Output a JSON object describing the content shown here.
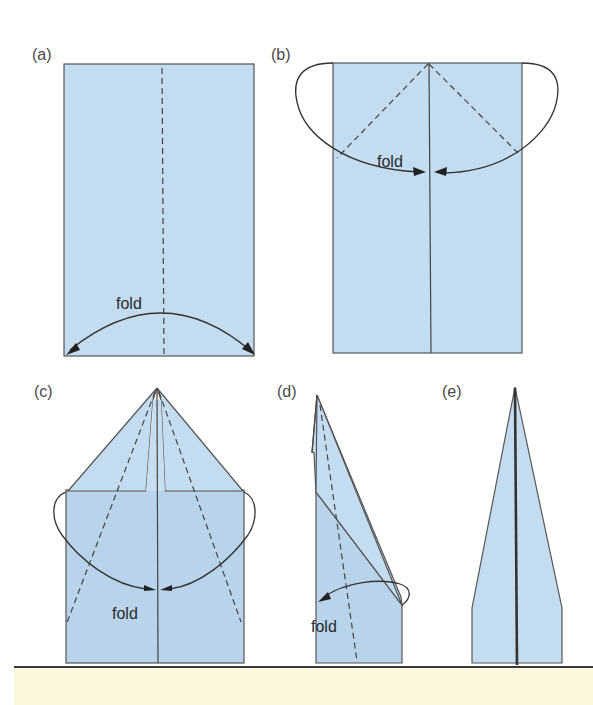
{
  "figure": {
    "colors": {
      "paper": "#c4dcef",
      "paper_shade": "#b8d3ea",
      "line": "#444444",
      "footer": "#fbf6dc"
    },
    "panels": [
      {
        "id": "a",
        "label": "(a)",
        "fold_label": "fold",
        "description": "Rectangle sheet folded in half lengthwise along dashed center line"
      },
      {
        "id": "b",
        "label": "(b)",
        "fold_label": "fold",
        "description": "Top corners folded down to the center crease"
      },
      {
        "id": "c",
        "label": "(c)",
        "fold_label": "fold",
        "description": "Diagonal edges folded again to the center line"
      },
      {
        "id": "d",
        "label": "(d)",
        "fold_label": "fold",
        "description": "Folded in half, wing folded down along dashed line"
      },
      {
        "id": "e",
        "label": "(e)",
        "description": "Finished paper airplane"
      }
    ]
  }
}
